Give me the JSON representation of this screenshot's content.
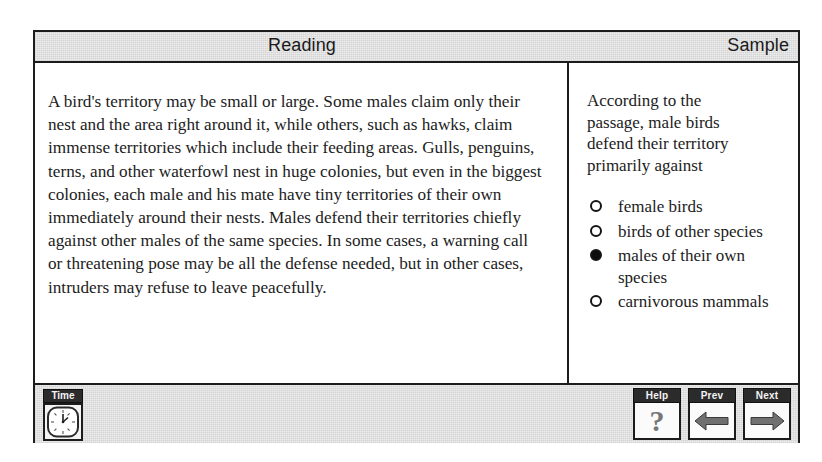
{
  "header": {
    "title": "Reading",
    "section": "Sample"
  },
  "passage": {
    "text": "A bird's territory may be small or large. Some males claim only their nest and the area right around it, while others, such as hawks, claim immense territories which include their feeding areas. Gulls, penguins, terns, and other waterfowl nest in huge colonies, but even in the biggest colonies, each male and his mate have tiny territories of their own immediately around their nests. Males defend their territories chiefly against other males of the same species. In some cases, a warning call or threatening pose may be all the defense needed, but in other cases, intruders may refuse to leave peacefully."
  },
  "question": {
    "stem": "According to the passage, male birds defend their territory primarily against",
    "options": [
      {
        "label": "female birds",
        "selected": false
      },
      {
        "label": "birds of other species",
        "selected": false
      },
      {
        "label": "males of their own species",
        "selected": true
      },
      {
        "label": "carnivorous mammals",
        "selected": false
      }
    ]
  },
  "footer": {
    "time_label": "Time",
    "clock_icon": "clock-icon",
    "buttons": [
      {
        "label": "Help",
        "icon": "question-mark-icon"
      },
      {
        "label": "Prev",
        "icon": "arrow-left-icon"
      },
      {
        "label": "Next",
        "icon": "arrow-right-icon"
      }
    ]
  },
  "colors": {
    "frame": "#1c1c1c",
    "band": "#ececec",
    "cap": "#2b2b2b",
    "arrow": "#6e6e6e"
  }
}
